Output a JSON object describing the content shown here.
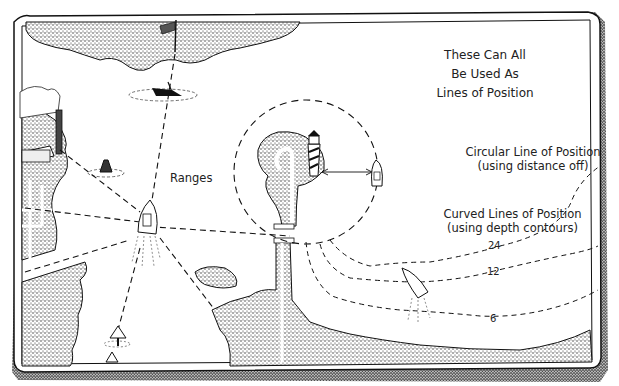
{
  "diagram": {
    "title_lines": [
      "These Can All",
      "Be Used As",
      "Lines of Position"
    ],
    "labels": {
      "ranges": "Ranges",
      "circular_line": "Circular Line of Position",
      "circular_sub": "(using distance off)",
      "curved_lines": "Curved Lines of Position",
      "curved_sub": "(using depth contours)"
    },
    "depth_contours": [
      "24",
      "12",
      "6"
    ],
    "elements": [
      "flagpole",
      "sunken wreck marker",
      "smokestack factory",
      "buoy",
      "lighthouse",
      "boat with range lines",
      "boat at distance off",
      "boat crossing depth contours",
      "range markers",
      "jetty pier"
    ],
    "colors": {
      "ink": "#1a1a1a",
      "paper": "#ffffff",
      "land_stipple": "#9a9a9a"
    }
  }
}
